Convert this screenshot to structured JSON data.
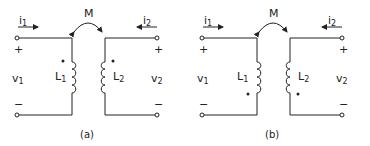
{
  "diagrams": [
    {
      "id": "a",
      "caption": "(a)",
      "mutual_label": "M",
      "i1": "i",
      "i1_sub": "1",
      "i2": "i",
      "i2_sub": "2",
      "v1": "v",
      "v1_sub": "1",
      "v2": "v",
      "v2_sub": "2",
      "L1": "L",
      "L1_sub": "1",
      "L2": "L",
      "L2_sub": "2",
      "plus": "+",
      "minus": "−",
      "dot_position": "top"
    },
    {
      "id": "b",
      "caption": "(b)",
      "mutual_label": "M",
      "i1": "i",
      "i1_sub": "1",
      "i2": "i",
      "i2_sub": "2",
      "v1": "v",
      "v1_sub": "1",
      "v2": "v",
      "v2_sub": "2",
      "L1": "L",
      "L1_sub": "1",
      "L2": "L",
      "L2_sub": "2",
      "plus": "+",
      "minus": "−",
      "dot_position": "bottom"
    }
  ],
  "colors": {
    "ink": "#222222",
    "background": "#ffffff"
  }
}
